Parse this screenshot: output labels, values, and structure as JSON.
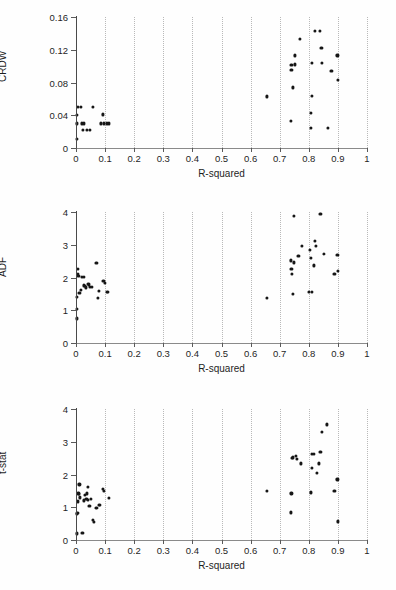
{
  "figure": {
    "background": "#ffffff",
    "marker_color": "#161616",
    "grid_color": "#b9b9b9",
    "axis_color": "#8a8a8a"
  },
  "chart_data": [
    {
      "type": "scatter",
      "title": "",
      "xlabel": "R-squared",
      "ylabel": "CRDW",
      "xlim": [
        0,
        1
      ],
      "ylim": [
        0,
        0.16
      ],
      "xticks": [
        0,
        0.1,
        0.2,
        0.3,
        0.4,
        0.5,
        0.6,
        0.7,
        0.8,
        0.9,
        1
      ],
      "xticklabels": [
        "0",
        "0.1",
        "0.2",
        "0.3",
        "0.4",
        "0.5",
        "0.6",
        "0.7",
        "0.8",
        "0.9",
        "1"
      ],
      "yticks": [
        0,
        0.04,
        0.08,
        0.12,
        0.16
      ],
      "yticklabels": [
        "0",
        "0.04",
        "0.08",
        "0.12",
        "0.16"
      ],
      "grid": "vertical-dotted",
      "legend": "none",
      "points": [
        [
          0.003,
          0.011
        ],
        [
          0.003,
          0.04
        ],
        [
          0.006,
          0.05
        ],
        [
          0.004,
          0.03
        ],
        [
          0.016,
          0.05
        ],
        [
          0.02,
          0.03
        ],
        [
          0.024,
          0.022
        ],
        [
          0.028,
          0.03
        ],
        [
          0.038,
          0.022
        ],
        [
          0.048,
          0.022
        ],
        [
          0.058,
          0.05
        ],
        [
          0.086,
          0.03
        ],
        [
          0.092,
          0.041
        ],
        [
          0.096,
          0.03
        ],
        [
          0.106,
          0.03
        ],
        [
          0.112,
          0.03
        ],
        [
          0.655,
          0.063
        ],
        [
          0.738,
          0.033
        ],
        [
          0.74,
          0.101
        ],
        [
          0.74,
          0.095
        ],
        [
          0.745,
          0.074
        ],
        [
          0.752,
          0.113
        ],
        [
          0.752,
          0.102
        ],
        [
          0.77,
          0.133
        ],
        [
          0.806,
          0.025
        ],
        [
          0.808,
          0.043
        ],
        [
          0.81,
          0.064
        ],
        [
          0.812,
          0.104
        ],
        [
          0.82,
          0.143
        ],
        [
          0.838,
          0.143
        ],
        [
          0.843,
          0.122
        ],
        [
          0.845,
          0.104
        ],
        [
          0.866,
          0.025
        ],
        [
          0.878,
          0.094
        ],
        [
          0.898,
          0.113
        ],
        [
          0.9,
          0.083
        ]
      ]
    },
    {
      "type": "scatter",
      "title": "",
      "xlabel": "R-squared",
      "ylabel": "ADF",
      "xlim": [
        0,
        1
      ],
      "ylim": [
        0,
        4
      ],
      "xticks": [
        0,
        0.1,
        0.2,
        0.3,
        0.4,
        0.5,
        0.6,
        0.7,
        0.8,
        0.9,
        1
      ],
      "xticklabels": [
        "0",
        "0.1",
        "0.2",
        "0.3",
        "0.4",
        "0.5",
        "0.6",
        "0.7",
        "0.8",
        "0.9",
        "1"
      ],
      "yticks": [
        0,
        1,
        2,
        3,
        4
      ],
      "yticklabels": [
        "0",
        "1",
        "2",
        "3",
        "4"
      ],
      "grid": "vertical-dotted",
      "legend": "none",
      "points": [
        [
          0.003,
          0.75
        ],
        [
          0.003,
          1.05
        ],
        [
          0.004,
          1.4
        ],
        [
          0.006,
          2.27
        ],
        [
          0.006,
          2.1
        ],
        [
          0.008,
          2.05
        ],
        [
          0.012,
          1.52
        ],
        [
          0.016,
          1.63
        ],
        [
          0.02,
          2.02
        ],
        [
          0.026,
          2.02
        ],
        [
          0.028,
          1.76
        ],
        [
          0.031,
          1.74
        ],
        [
          0.034,
          1.7
        ],
        [
          0.04,
          1.8
        ],
        [
          0.044,
          1.79
        ],
        [
          0.049,
          1.72
        ],
        [
          0.056,
          1.72
        ],
        [
          0.07,
          2.45
        ],
        [
          0.074,
          1.37
        ],
        [
          0.08,
          1.58
        ],
        [
          0.094,
          1.9
        ],
        [
          0.098,
          1.83
        ],
        [
          0.106,
          1.57
        ],
        [
          0.11,
          1.57
        ],
        [
          0.655,
          1.37
        ],
        [
          0.738,
          2.52
        ],
        [
          0.74,
          2.27
        ],
        [
          0.742,
          2.1
        ],
        [
          0.744,
          1.5
        ],
        [
          0.748,
          2.46
        ],
        [
          0.75,
          3.88
        ],
        [
          0.764,
          2.66
        ],
        [
          0.776,
          2.97
        ],
        [
          0.8,
          1.55
        ],
        [
          0.805,
          2.85
        ],
        [
          0.808,
          2.6
        ],
        [
          0.81,
          1.56
        ],
        [
          0.818,
          2.37
        ],
        [
          0.82,
          3.12
        ],
        [
          0.824,
          2.96
        ],
        [
          0.84,
          3.95
        ],
        [
          0.852,
          2.73
        ],
        [
          0.888,
          2.12
        ],
        [
          0.898,
          2.7
        ],
        [
          0.9,
          2.21
        ]
      ]
    },
    {
      "type": "scatter",
      "title": "",
      "xlabel": "R-squared",
      "ylabel": "t-stat",
      "xlim": [
        0,
        1
      ],
      "ylim": [
        0,
        4
      ],
      "xticks": [
        0,
        0.1,
        0.2,
        0.3,
        0.4,
        0.5,
        0.6,
        0.7,
        0.8,
        0.9,
        1
      ],
      "xticklabels": [
        "0",
        "0.1",
        "0.2",
        "0.3",
        "0.4",
        "0.5",
        "0.6",
        "0.7",
        "0.8",
        "0.9",
        "1"
      ],
      "yticks": [
        0,
        1,
        2,
        3,
        4
      ],
      "yticklabels": [
        "0",
        "1",
        "2",
        "3",
        "4"
      ],
      "grid": "vertical-dotted",
      "legend": "none",
      "points": [
        [
          0.003,
          0.2
        ],
        [
          0.004,
          0.8
        ],
        [
          0.005,
          0.82
        ],
        [
          0.006,
          1.18
        ],
        [
          0.008,
          1.42
        ],
        [
          0.01,
          1.4
        ],
        [
          0.012,
          1.7
        ],
        [
          0.014,
          1.3
        ],
        [
          0.022,
          0.22
        ],
        [
          0.028,
          1.21
        ],
        [
          0.032,
          1.38
        ],
        [
          0.036,
          1.26
        ],
        [
          0.038,
          1.42
        ],
        [
          0.04,
          1.22
        ],
        [
          0.042,
          1.62
        ],
        [
          0.046,
          1.05
        ],
        [
          0.05,
          1.25
        ],
        [
          0.058,
          0.62
        ],
        [
          0.062,
          0.56
        ],
        [
          0.07,
          0.98
        ],
        [
          0.078,
          1.08
        ],
        [
          0.082,
          1.06
        ],
        [
          0.092,
          1.55
        ],
        [
          0.096,
          1.5
        ],
        [
          0.112,
          1.28
        ],
        [
          0.655,
          1.5
        ],
        [
          0.738,
          0.84
        ],
        [
          0.74,
          1.42
        ],
        [
          0.742,
          2.5
        ],
        [
          0.744,
          2.52
        ],
        [
          0.756,
          2.57
        ],
        [
          0.758,
          2.48
        ],
        [
          0.772,
          2.34
        ],
        [
          0.806,
          1.45
        ],
        [
          0.808,
          1.47
        ],
        [
          0.81,
          2.62
        ],
        [
          0.812,
          2.2
        ],
        [
          0.818,
          2.62
        ],
        [
          0.828,
          2.05
        ],
        [
          0.834,
          2.34
        ],
        [
          0.84,
          2.68
        ],
        [
          0.846,
          3.3
        ],
        [
          0.862,
          3.53
        ],
        [
          0.888,
          1.5
        ],
        [
          0.898,
          1.85
        ],
        [
          0.9,
          0.57
        ]
      ]
    }
  ]
}
